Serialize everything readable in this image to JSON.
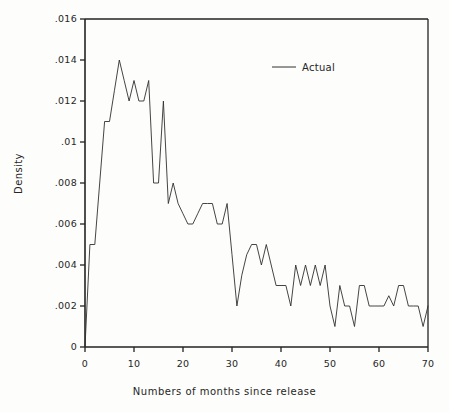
{
  "chart_data": {
    "type": "line",
    "title": "",
    "xlabel": "Numbers of months since release",
    "ylabel": "Density",
    "xlim": [
      0,
      70
    ],
    "ylim": [
      0,
      0.016
    ],
    "grid": false,
    "legend_position": "top-right",
    "legend": [
      "Actual"
    ],
    "xticks": [
      0,
      10,
      20,
      30,
      40,
      50,
      60,
      70
    ],
    "xtick_labels": [
      "0",
      "10",
      "20",
      "30",
      "40",
      "50",
      "60",
      "70"
    ],
    "yticks": [
      0,
      0.002,
      0.004,
      0.006,
      0.008,
      0.01,
      0.012,
      0.014,
      0.016
    ],
    "ytick_labels": [
      "0",
      ".002",
      ".004",
      ".006",
      ".008",
      ".01",
      ".012",
      ".014",
      ".016"
    ],
    "series": [
      {
        "name": "Actual",
        "color": "#303030",
        "x": [
          0,
          1,
          2,
          3,
          4,
          5,
          6,
          7,
          8,
          9,
          10,
          11,
          12,
          13,
          14,
          15,
          16,
          17,
          18,
          19,
          20,
          21,
          22,
          23,
          24,
          25,
          26,
          27,
          28,
          29,
          30,
          31,
          32,
          33,
          34,
          35,
          36,
          37,
          38,
          39,
          40,
          41,
          42,
          43,
          44,
          45,
          46,
          47,
          48,
          49,
          50,
          51,
          52,
          53,
          54,
          55,
          56,
          57,
          58,
          59,
          60,
          61,
          62,
          63,
          64,
          65,
          66,
          67,
          68,
          69,
          70
        ],
        "y": [
          0.0,
          0.005,
          0.005,
          0.008,
          0.011,
          0.011,
          0.0125,
          0.014,
          0.013,
          0.012,
          0.013,
          0.012,
          0.012,
          0.013,
          0.008,
          0.008,
          0.012,
          0.007,
          0.008,
          0.007,
          0.0065,
          0.006,
          0.006,
          0.0065,
          0.007,
          0.007,
          0.007,
          0.006,
          0.006,
          0.007,
          0.0045,
          0.002,
          0.0035,
          0.0045,
          0.005,
          0.005,
          0.004,
          0.005,
          0.004,
          0.003,
          0.003,
          0.003,
          0.002,
          0.004,
          0.003,
          0.004,
          0.003,
          0.004,
          0.003,
          0.004,
          0.002,
          0.001,
          0.003,
          0.002,
          0.002,
          0.001,
          0.003,
          0.003,
          0.002,
          0.002,
          0.002,
          0.002,
          0.0025,
          0.002,
          0.003,
          0.003,
          0.002,
          0.002,
          0.002,
          0.001,
          0.002
        ]
      }
    ]
  },
  "legend_entry": {
    "label": "Actual"
  },
  "axis": {
    "ylabel": "Density",
    "xlabel": "Numbers of months since release"
  }
}
